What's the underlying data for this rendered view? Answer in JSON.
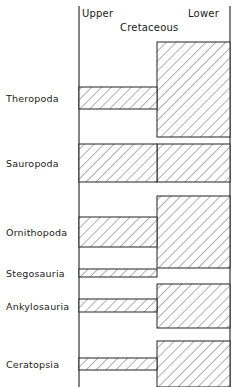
{
  "chart_data": {
    "type": "bar",
    "title": "Cretaceous",
    "subtitle": "",
    "xlabel": "",
    "ylabel": "",
    "orientation": "horizontal",
    "grid": false,
    "legend": false,
    "axis_header_left": "Upper",
    "axis_header_right": "Lower",
    "axis_divider_label": "Cretaceous",
    "x_axis_note": "Left side = Upper Cretaceous, right side = Lower Cretaceous; bar width/thickness indicates relative diversity or abundance",
    "x_divider_fraction": 0.52,
    "categories": [
      "Theropoda",
      "Sauropoda",
      "Ornithopoda",
      "Stegosauria",
      "Ankylosauria",
      "Ceratopsia"
    ],
    "series": [
      {
        "name": "Upper Cretaceous",
        "units": "relative thickness (px)",
        "values": [
          22,
          38,
          30,
          8,
          13,
          12
        ]
      },
      {
        "name": "Lower Cretaceous",
        "units": "relative thickness (px)",
        "values": [
          95,
          38,
          72,
          0,
          44,
          46
        ]
      }
    ],
    "bars": [
      {
        "category": "Theropoda",
        "center_y": 98,
        "upper": {
          "present": true,
          "x0": 79,
          "x1": 157,
          "y0": 87,
          "y1": 109
        },
        "lower": {
          "present": true,
          "x0": 157,
          "x1": 230,
          "y0": 42,
          "y1": 137
        }
      },
      {
        "category": "Sauropoda",
        "center_y": 163,
        "upper": {
          "present": true,
          "x0": 79,
          "x1": 157,
          "y0": 144,
          "y1": 182
        },
        "lower": {
          "present": true,
          "x0": 157,
          "x1": 230,
          "y0": 144,
          "y1": 182
        }
      },
      {
        "category": "Ornithopoda",
        "center_y": 232,
        "upper": {
          "present": true,
          "x0": 79,
          "x1": 157,
          "y0": 217,
          "y1": 247
        },
        "lower": {
          "present": true,
          "x0": 157,
          "x1": 230,
          "y0": 196,
          "y1": 268
        }
      },
      {
        "category": "Stegosauria",
        "center_y": 273,
        "upper": {
          "present": true,
          "x0": 79,
          "x1": 157,
          "y0": 269,
          "y1": 277
        },
        "lower": {
          "present": false,
          "x0": 157,
          "x1": 230,
          "y0": 0,
          "y1": 0
        }
      },
      {
        "category": "Ankylosauria",
        "center_y": 306,
        "upper": {
          "present": true,
          "x0": 79,
          "x1": 157,
          "y0": 299,
          "y1": 312
        },
        "lower": {
          "present": true,
          "x0": 157,
          "x1": 230,
          "y0": 284,
          "y1": 328
        }
      },
      {
        "category": "Ceratopsia",
        "center_y": 364,
        "upper": {
          "present": true,
          "x0": 79,
          "x1": 157,
          "y0": 358,
          "y1": 370
        },
        "lower": {
          "present": true,
          "x0": 157,
          "x1": 230,
          "y0": 341,
          "y1": 387
        }
      }
    ],
    "axes": {
      "left_spine_x": 79,
      "right_spine_x": 230,
      "top_y": 6,
      "bottom_y": 387
    },
    "style": {
      "fill": "#ffffff",
      "hatch": "diagonal-45",
      "hatch_color": "#777777",
      "stroke": "#222222",
      "background": "#ffffff"
    }
  }
}
